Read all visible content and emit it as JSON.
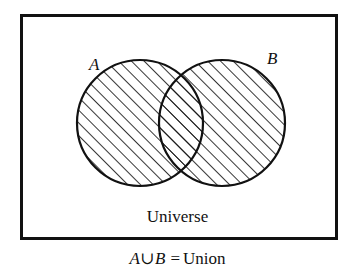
{
  "figure": {
    "type": "venn-diagram",
    "title": "",
    "universe_label": "Universe",
    "caption": {
      "left_set": "A",
      "operator": "∪",
      "right_set": "B",
      "equals": "=",
      "result": "Union",
      "full_text": "A∪B = Union"
    },
    "sets": [
      {
        "id": "A",
        "label": "A",
        "shaded": true
      },
      {
        "id": "B",
        "label": "B",
        "shaded": true
      }
    ],
    "shaded_region": "A ∪ B",
    "colors": {
      "background": "#ffffff",
      "ink": "#111111",
      "hatch": "#111111",
      "border": "#111111"
    },
    "geometry": {
      "box": {
        "x": 20,
        "y": 14,
        "width": 318,
        "height": 226,
        "border_width": 3
      },
      "circle_a": {
        "cx": 120,
        "cy": 109,
        "r": 63
      },
      "circle_b": {
        "cx": 202,
        "cy": 109,
        "r": 63
      },
      "hatch_angle_deg": 45,
      "hatch_spacing": 9
    }
  }
}
